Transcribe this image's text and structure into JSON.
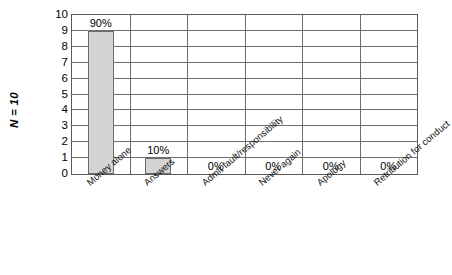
{
  "chart_data": {
    "type": "bar",
    "title": "",
    "subtitle": "",
    "xlabel": "",
    "ylabel": "N = 10",
    "ylim": [
      0,
      10
    ],
    "yticks": [
      "10",
      "9",
      "8",
      "7",
      "6",
      "5",
      "4",
      "3",
      "2",
      "1",
      "0"
    ],
    "grid": true,
    "legend": false,
    "categories": [
      "Money alone",
      "Answers",
      "Admit fault/responsibility",
      "Never again",
      "Apology",
      "Retribution for conduct"
    ],
    "values": [
      9,
      1,
      0,
      0,
      0,
      0
    ],
    "data_labels": [
      "90%",
      "10%",
      "0%",
      "0%",
      "0%",
      "0%"
    ],
    "series": [
      {
        "name": "",
        "values": [
          9,
          1,
          0,
          0,
          0,
          0
        ]
      }
    ]
  },
  "style": {
    "bar_fill": "#d4d4d4",
    "bar_border": "#6b6b6b",
    "grid_color": "#6e6e6e",
    "frame_color": "#5a5a5a",
    "background": "#ffffff",
    "text_color": "#1a1a1a"
  }
}
